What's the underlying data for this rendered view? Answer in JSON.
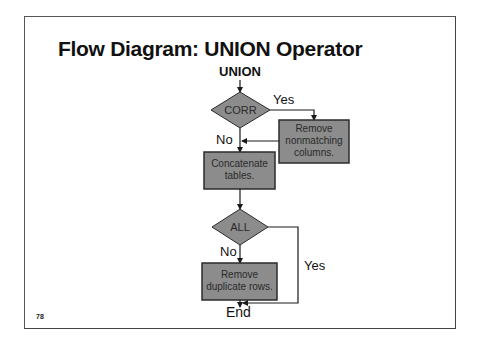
{
  "slide": {
    "title": "Flow Diagram: UNION Operator",
    "page_number": "78"
  },
  "diagram": {
    "start": "UNION",
    "end": "End",
    "decisions": [
      {
        "id": "corr",
        "label": "CORR",
        "yes_label": "Yes",
        "no_label": "No"
      },
      {
        "id": "all",
        "label": "ALL",
        "yes_label": "Yes",
        "no_label": "No"
      }
    ],
    "processes": [
      {
        "id": "remove-nonmatching",
        "line1": "Remove",
        "line2": "nonmatching",
        "line3": "columns."
      },
      {
        "id": "concatenate",
        "line1": "Concatenate",
        "line2": "tables."
      },
      {
        "id": "remove-duplicates",
        "line1": "Remove",
        "line2": "duplicate rows."
      }
    ],
    "colors": {
      "shape_fill": "#8c8c8c",
      "shape_stroke": "#2b2b2b",
      "line": "#1a1a1a",
      "text": "#2a2a2a"
    }
  }
}
